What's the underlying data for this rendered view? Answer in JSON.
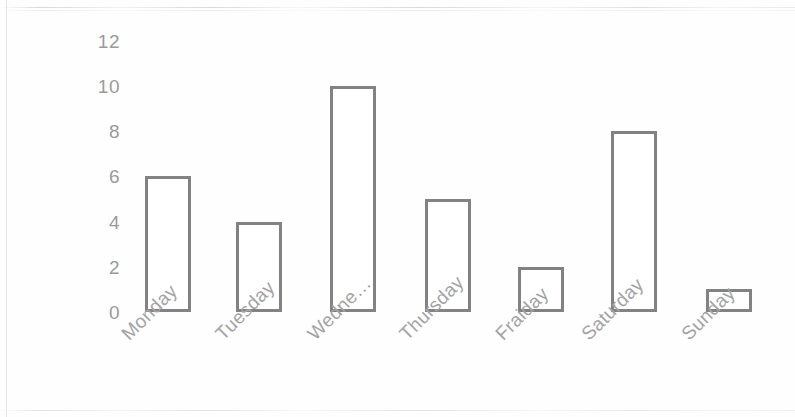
{
  "chart_data": {
    "type": "bar",
    "title": "",
    "subtitle": "",
    "xlabel": "",
    "ylabel": "",
    "categories": [
      "Monday",
      "Tuesday",
      "Wedne…",
      "Thursday",
      "Fraiday",
      "Saturday",
      "Sunday"
    ],
    "values": [
      6,
      4,
      10,
      5,
      2,
      8,
      1
    ],
    "ylim": [
      0,
      12
    ],
    "y_ticks": [
      0,
      2,
      4,
      6,
      8,
      10,
      12
    ],
    "y_tick_labels": [
      "0",
      "2",
      "4",
      "6",
      "8",
      "10",
      "12"
    ],
    "grid": false,
    "legend": null,
    "bar_style": "outlined",
    "bar_fill_color": "#ffffff",
    "bar_stroke_color": "#828284",
    "axis_label_color": "#9a9a9c",
    "category_label_color": "#a3a3a6",
    "category_label_rotation_deg": -45,
    "background_color": "#fefefe"
  },
  "axis": {
    "y_tick_labels": [
      "12",
      "10",
      "8",
      "6",
      "4",
      "2",
      "0"
    ]
  },
  "bars": [
    {
      "label": "Monday",
      "value": 6,
      "value_text": "6"
    },
    {
      "label": "Tuesday",
      "value": 4,
      "value_text": "4"
    },
    {
      "label": "Wedne…",
      "value": 10,
      "value_text": "10"
    },
    {
      "label": "Thursday",
      "value": 5,
      "value_text": "5"
    },
    {
      "label": "Fraiday",
      "value": 2,
      "value_text": "2"
    },
    {
      "label": "Saturday",
      "value": 8,
      "value_text": "8"
    },
    {
      "label": "Sunday",
      "value": 1,
      "value_text": "1"
    }
  ]
}
